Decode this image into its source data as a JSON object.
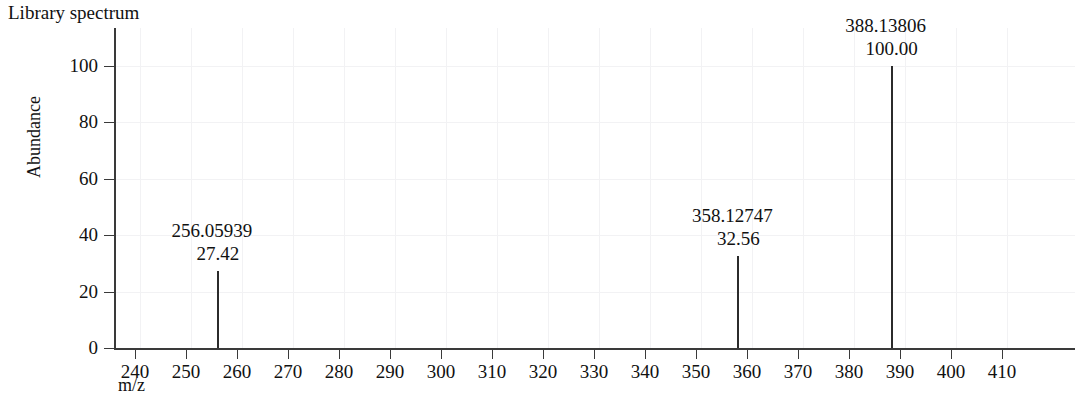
{
  "title": "Library spectrum",
  "axes": {
    "x_label": "m/z",
    "y_label": "Abundance",
    "x_ticks": [
      240,
      250,
      260,
      270,
      280,
      290,
      300,
      310,
      320,
      330,
      340,
      350,
      360,
      370,
      380,
      390,
      400,
      410
    ],
    "y_ticks": [
      0,
      20,
      40,
      60,
      80,
      100
    ]
  },
  "colors": {
    "axis": "#3a3a3a",
    "peak": "#2b2b2b",
    "grid": "#f2f2f4",
    "text": "#111111",
    "background": "#ffffff"
  },
  "chart_data": {
    "type": "bar",
    "title": "Library spectrum",
    "xlabel": "m/z",
    "ylabel": "Abundance",
    "xlim": [
      232,
      420
    ],
    "ylim": [
      0,
      108
    ],
    "grid": true,
    "legend": "none",
    "x": [
      256.05939,
      358.12747,
      388.13806
    ],
    "values": [
      27.42,
      32.56,
      100.0
    ],
    "peaks": [
      {
        "mz": "256.05939",
        "abundance": "27.42",
        "mz_value": 256.05939,
        "abundance_value": 27.42
      },
      {
        "mz": "358.12747",
        "abundance": "32.56",
        "mz_value": 358.12747,
        "abundance_value": 32.56
      },
      {
        "mz": "388.13806",
        "abundance": "100.00",
        "mz_value": 388.13806,
        "abundance_value": 100.0
      }
    ]
  }
}
